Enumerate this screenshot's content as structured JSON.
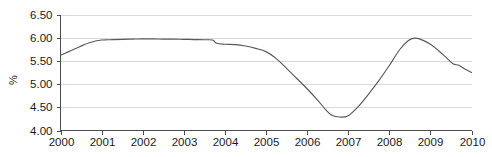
{
  "chart_data": {
    "type": "line",
    "title": "",
    "subtitle": "",
    "xlabel": "",
    "ylabel": "%",
    "ylim": [
      4.0,
      6.5
    ],
    "xlim": [
      2000,
      2010
    ],
    "grid": true,
    "legend": false,
    "legend_position": "none",
    "line_color": "#595959",
    "grid_color": "#d9d9d9",
    "axis_color": "#4d4d4d",
    "text_color": "#1a1a1a",
    "background_color": "#ffffff",
    "ytick_labels": [
      "6.50",
      "6.00",
      "5.50",
      "5.00",
      "4.50",
      "4.00"
    ],
    "ytick_values": [
      6.5,
      6.0,
      5.5,
      5.0,
      4.5,
      4.0
    ],
    "xtick_labels": [
      "2000",
      "2001",
      "2002",
      "2003",
      "2004",
      "2005",
      "2006",
      "2007",
      "2008",
      "2009",
      "2010"
    ],
    "xtick_values": [
      2000,
      2001,
      2002,
      2003,
      2004,
      2005,
      2006,
      2007,
      2008,
      2009,
      2010
    ],
    "series": [
      {
        "name": "rate",
        "x": [
          2000.0,
          2000.1,
          2000.25,
          2000.4,
          2000.55,
          2000.7,
          2000.85,
          2001.0,
          2001.15,
          2001.3,
          2001.5,
          2001.75,
          2002.0,
          2002.25,
          2002.5,
          2002.75,
          2003.0,
          2003.25,
          2003.5,
          2003.7,
          2003.8,
          2004.0,
          2004.25,
          2004.5,
          2004.75,
          2005.0,
          2005.25,
          2005.5,
          2005.75,
          2006.0,
          2006.25,
          2006.45,
          2006.6,
          2006.8,
          2007.0,
          2007.25,
          2007.5,
          2007.75,
          2008.0,
          2008.25,
          2008.45,
          2008.6,
          2008.75,
          2009.0,
          2009.2,
          2009.4,
          2009.55,
          2009.7,
          2009.85,
          2010.0
        ],
        "y": [
          5.62,
          5.66,
          5.72,
          5.78,
          5.84,
          5.89,
          5.93,
          5.95,
          5.955,
          5.96,
          5.965,
          5.97,
          5.975,
          5.975,
          5.97,
          5.97,
          5.965,
          5.96,
          5.955,
          5.95,
          5.88,
          5.86,
          5.85,
          5.82,
          5.77,
          5.7,
          5.55,
          5.34,
          5.12,
          4.9,
          4.66,
          4.45,
          4.33,
          4.29,
          4.32,
          4.52,
          4.79,
          5.08,
          5.4,
          5.74,
          5.93,
          5.99,
          5.97,
          5.86,
          5.72,
          5.56,
          5.44,
          5.4,
          5.32,
          5.25
        ]
      }
    ]
  }
}
